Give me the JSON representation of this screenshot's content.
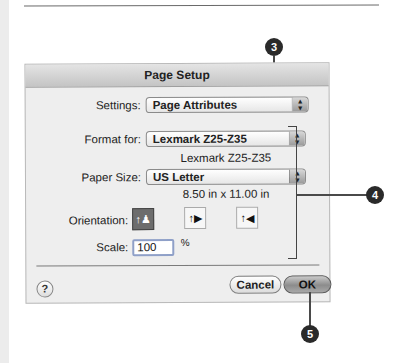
{
  "dialog": {
    "title": "Page Setup",
    "settings": {
      "label": "Settings:",
      "value": "Page Attributes"
    },
    "format_for": {
      "label": "Format for:",
      "value": "Lexmark Z25-Z35",
      "info": "Lexmark Z25-Z35"
    },
    "paper_size": {
      "label": "Paper Size:",
      "value": "US Letter",
      "info": "8.50 in x 11.00 in"
    },
    "orientation": {
      "label": "Orientation:",
      "options": [
        {
          "name": "portrait",
          "glyph": "↑♟",
          "selected": true
        },
        {
          "name": "landscape-left",
          "glyph": "↑▶",
          "selected": false
        },
        {
          "name": "landscape-right",
          "glyph": "↑◀",
          "selected": false
        }
      ]
    },
    "scale": {
      "label": "Scale:",
      "value": "100",
      "unit": "%"
    },
    "help_glyph": "?",
    "buttons": {
      "cancel": "Cancel",
      "ok": "OK"
    },
    "popup_arrows": "▲\n▼"
  },
  "callouts": {
    "c3": "3",
    "c4": "4",
    "c5": "5"
  }
}
